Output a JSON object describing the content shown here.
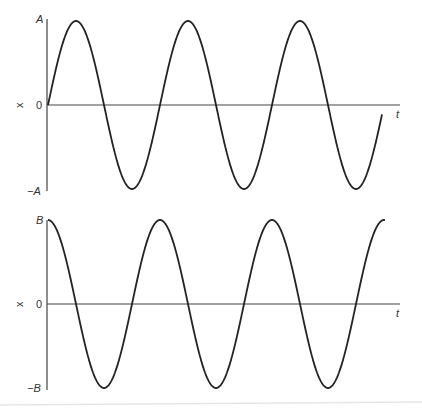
{
  "chart_data": [
    {
      "type": "line",
      "title": "",
      "xlabel": "t",
      "ylabel": "x",
      "function": "x = A sin(ωt)",
      "y_ticks": [
        "A",
        "0",
        "−A"
      ],
      "periods_shown": 3,
      "grid": false,
      "series": [
        {
          "name": "sine",
          "shape": "sine",
          "amplitude_label": "A",
          "cycles": 3
        }
      ]
    },
    {
      "type": "line",
      "title": "",
      "xlabel": "t",
      "ylabel": "x",
      "function": "x = B cos(ωt)",
      "y_ticks": [
        "B",
        "0",
        "−B"
      ],
      "periods_shown": 3,
      "grid": false,
      "series": [
        {
          "name": "cosine",
          "shape": "cosine",
          "amplitude_label": "B",
          "cycles": 3
        }
      ]
    }
  ],
  "top": {
    "ylabel": "x",
    "ymax": "A",
    "zero": "0",
    "ymin": "−A",
    "xlabel": "t"
  },
  "bottom": {
    "ylabel": "x",
    "ymax": "B",
    "zero": "0",
    "ymin": "−B",
    "xlabel": "t"
  },
  "colors": {
    "curve": "#222222",
    "axis": "#444444",
    "label": "#333333"
  }
}
